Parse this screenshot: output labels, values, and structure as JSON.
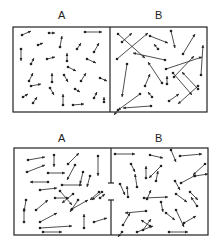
{
  "panels": [
    {
      "name": "top-panel",
      "labels": [
        {
          "text": "A",
          "x": 58,
          "y": 10
        },
        {
          "text": "B",
          "x": 155,
          "y": 10
        }
      ],
      "box": {
        "x": 13,
        "y": 27,
        "w": 194,
        "h": 85
      },
      "divider": {
        "x": 110,
        "gap": null
      },
      "arrows": [
        [
          22,
          35,
          31,
          31
        ],
        [
          49,
          33,
          55,
          33
        ],
        [
          85,
          32,
          102,
          32
        ],
        [
          38,
          45,
          43,
          43
        ],
        [
          60,
          47,
          62,
          36
        ],
        [
          77,
          49,
          81,
          43
        ],
        [
          94,
          52,
          99,
          43
        ],
        [
          21,
          49,
          21,
          61
        ],
        [
          31,
          64,
          34,
          58
        ],
        [
          47,
          59,
          55,
          57
        ],
        [
          67,
          61,
          67,
          53
        ],
        [
          87,
          59,
          96,
          63
        ],
        [
          68,
          67,
          76,
          71
        ],
        [
          29,
          81,
          33,
          73
        ],
        [
          52,
          82,
          52,
          73
        ],
        [
          64,
          75,
          68,
          82
        ],
        [
          81,
          81,
          86,
          73
        ],
        [
          100,
          78,
          107,
          81
        ],
        [
          31,
          86,
          41,
          84
        ],
        [
          50,
          88,
          54,
          95
        ],
        [
          75,
          89,
          80,
          92
        ],
        [
          94,
          98,
          97,
          92
        ],
        [
          23,
          97,
          28,
          94
        ],
        [
          33,
          103,
          37,
          97
        ],
        [
          63,
          105,
          63,
          94
        ],
        [
          73,
          105,
          84,
          104
        ],
        [
          104,
          102,
          104,
          97
        ],
        [
          118,
          34,
          145,
          58
        ],
        [
          122,
          42,
          132,
          33
        ],
        [
          117,
          59,
          148,
          33
        ],
        [
          150,
          36,
          168,
          43
        ],
        [
          171,
          31,
          175,
          48
        ],
        [
          183,
          54,
          195,
          34
        ],
        [
          165,
          60,
          133,
          53
        ],
        [
          158,
          49,
          154,
          44
        ],
        [
          174,
          77,
          194,
          56
        ],
        [
          166,
          69,
          202,
          57
        ],
        [
          201,
          75,
          203,
          45
        ],
        [
          127,
          64,
          122,
          97
        ],
        [
          162,
          83,
          148,
          62
        ],
        [
          145,
          86,
          150,
          74
        ],
        [
          167,
          84,
          167,
          76
        ],
        [
          173,
          73,
          192,
          95
        ],
        [
          198,
          89,
          182,
          72
        ],
        [
          198,
          86,
          178,
          104
        ],
        [
          152,
          97,
          148,
          92
        ],
        [
          151,
          106,
          123,
          108
        ],
        [
          169,
          101,
          179,
          94
        ],
        [
          140,
          94,
          118,
          110
        ],
        [
          118,
          110,
          114,
          115
        ]
      ]
    },
    {
      "name": "bottom-panel",
      "labels": [
        {
          "text": "A",
          "x": 58,
          "y": 133
        },
        {
          "text": "B",
          "x": 155,
          "y": 133
        }
      ],
      "box": {
        "x": 14,
        "y": 148,
        "w": 194,
        "h": 87
      },
      "divider": {
        "x": 111,
        "gap": [
          183,
          200
        ]
      },
      "arrows": [
        [
          28,
          160,
          45,
          157
        ],
        [
          54,
          155,
          54,
          167
        ],
        [
          68,
          164,
          79,
          153
        ],
        [
          98,
          156,
          98,
          176
        ],
        [
          27,
          172,
          45,
          165
        ],
        [
          48,
          173,
          65,
          173
        ],
        [
          75,
          165,
          67,
          180
        ],
        [
          83,
          172,
          80,
          184
        ],
        [
          48,
          182,
          30,
          182
        ],
        [
          62,
          185,
          82,
          185
        ],
        [
          90,
          176,
          87,
          187
        ],
        [
          40,
          190,
          57,
          188
        ],
        [
          60,
          191,
          72,
          205
        ],
        [
          73,
          194,
          62,
          203
        ],
        [
          55,
          198,
          69,
          198
        ],
        [
          99,
          192,
          90,
          200
        ],
        [
          102,
          192,
          92,
          200
        ],
        [
          26,
          200,
          24,
          212
        ],
        [
          36,
          210,
          48,
          200
        ],
        [
          78,
          200,
          70,
          212
        ],
        [
          72,
          209,
          88,
          200
        ],
        [
          100,
          198,
          105,
          194
        ],
        [
          24,
          222,
          24,
          208
        ],
        [
          40,
          222,
          57,
          213
        ],
        [
          40,
          228,
          72,
          226
        ],
        [
          84,
          228,
          84,
          214
        ],
        [
          94,
          222,
          107,
          218
        ],
        [
          43,
          232,
          62,
          232
        ],
        [
          115,
          154,
          135,
          154
        ],
        [
          150,
          155,
          163,
          158
        ],
        [
          180,
          156,
          202,
          154
        ],
        [
          171,
          150,
          176,
          162
        ],
        [
          131,
          164,
          135,
          172
        ],
        [
          161,
          166,
          149,
          178
        ],
        [
          205,
          164,
          193,
          175
        ],
        [
          146,
          178,
          146,
          166
        ],
        [
          181,
          183,
          196,
          175
        ],
        [
          195,
          176,
          208,
          174
        ],
        [
          120,
          184,
          125,
          195
        ],
        [
          137,
          187,
          135,
          174
        ],
        [
          156,
          181,
          158,
          171
        ],
        [
          175,
          181,
          180,
          190
        ],
        [
          128,
          197,
          127,
          186
        ],
        [
          147,
          199,
          151,
          190
        ],
        [
          161,
          202,
          163,
          212
        ],
        [
          144,
          198,
          168,
          197
        ],
        [
          176,
          194,
          187,
          202
        ],
        [
          190,
          192,
          198,
          200
        ],
        [
          146,
          211,
          125,
          213
        ],
        [
          197,
          206,
          191,
          197
        ],
        [
          123,
          225,
          130,
          213
        ],
        [
          150,
          226,
          141,
          220
        ],
        [
          143,
          230,
          151,
          219
        ],
        [
          166,
          213,
          175,
          220
        ],
        [
          176,
          210,
          184,
          227
        ],
        [
          184,
          223,
          196,
          216
        ],
        [
          122,
          232,
          118,
          237
        ],
        [
          137,
          232,
          153,
          226
        ],
        [
          169,
          232,
          188,
          232
        ]
      ]
    }
  ],
  "colors": {
    "ink": "#222222",
    "background": "#ffffff"
  }
}
